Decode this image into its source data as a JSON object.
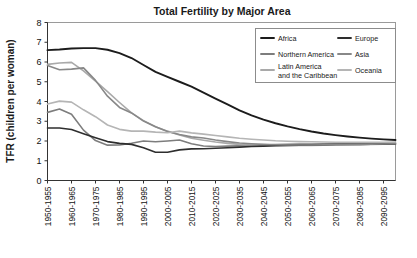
{
  "chart_data": {
    "type": "line",
    "title": "Total Fertility by Major Area",
    "xlabel": "",
    "ylabel": "TFR (children per woman)",
    "ylim": [
      0,
      8
    ],
    "yticks": [
      0,
      1,
      2,
      3,
      4,
      5,
      6,
      7,
      8
    ],
    "grid": false,
    "legend_position": "top-right",
    "categories": [
      "1950-1955",
      "1955-1960",
      "1960-1965",
      "1965-1970",
      "1970-1975",
      "1975-1980",
      "1980-1985",
      "1985-1990",
      "1990-1995",
      "1995-2000",
      "2000-2005",
      "2005-2010",
      "2010-2015",
      "2015-2020",
      "2020-2025",
      "2025-2030",
      "2030-2035",
      "2035-2040",
      "2040-2045",
      "2045-2050",
      "2050-2055",
      "2055-2060",
      "2060-2065",
      "2065-2070",
      "2070-2075",
      "2075-2080",
      "2080-2085",
      "2085-2090",
      "2090-2095",
      "2095-2100"
    ],
    "xtick_labels": [
      "1950-1955",
      "1960-1965",
      "1970-1975",
      "1980-1985",
      "1990-1995",
      "2000-2005",
      "2010-2015",
      "2020-2025",
      "2030-2035",
      "2040-2045",
      "2050-2055",
      "2060-2065",
      "2070-2075",
      "2080-2085",
      "2090-2095"
    ],
    "series": [
      {
        "name": "Africa",
        "color": "#1c1c1c",
        "width": 1.9,
        "values": [
          6.6,
          6.63,
          6.68,
          6.7,
          6.7,
          6.62,
          6.45,
          6.2,
          5.85,
          5.5,
          5.25,
          5.0,
          4.75,
          4.45,
          4.15,
          3.85,
          3.55,
          3.3,
          3.08,
          2.9,
          2.74,
          2.6,
          2.48,
          2.38,
          2.3,
          2.23,
          2.17,
          2.12,
          2.08,
          2.05
        ]
      },
      {
        "name": "Northern America",
        "color": "#7d7d7d",
        "width": 1.6,
        "values": [
          3.45,
          3.62,
          3.35,
          2.55,
          2.02,
          1.79,
          1.8,
          1.89,
          2.0,
          1.96,
          2.0,
          2.05,
          1.86,
          1.75,
          1.72,
          1.74,
          1.76,
          1.78,
          1.8,
          1.82,
          1.83,
          1.84,
          1.85,
          1.86,
          1.87,
          1.88,
          1.88,
          1.89,
          1.89,
          1.9
        ]
      },
      {
        "name": "Latin America and the Caribbean",
        "color": "#a9a9a9",
        "width": 1.6,
        "values": [
          5.88,
          5.95,
          5.98,
          5.55,
          5.03,
          4.5,
          3.95,
          3.42,
          3.03,
          2.72,
          2.5,
          2.3,
          2.14,
          2.04,
          1.95,
          1.88,
          1.83,
          1.8,
          1.78,
          1.77,
          1.77,
          1.77,
          1.78,
          1.79,
          1.8,
          1.81,
          1.82,
          1.83,
          1.84,
          1.85
        ]
      },
      {
        "name": "Europe",
        "color": "#2e2e2e",
        "width": 1.6,
        "values": [
          2.66,
          2.66,
          2.58,
          2.37,
          2.17,
          1.97,
          1.88,
          1.83,
          1.66,
          1.43,
          1.43,
          1.55,
          1.6,
          1.61,
          1.63,
          1.66,
          1.69,
          1.72,
          1.74,
          1.76,
          1.78,
          1.79,
          1.8,
          1.81,
          1.82,
          1.83,
          1.83,
          1.84,
          1.84,
          1.85
        ]
      },
      {
        "name": "Asia",
        "color": "#888888",
        "width": 1.6,
        "values": [
          5.82,
          5.61,
          5.64,
          5.7,
          5.07,
          4.27,
          3.7,
          3.42,
          3.01,
          2.72,
          2.48,
          2.33,
          2.21,
          2.15,
          2.05,
          1.97,
          1.9,
          1.86,
          1.83,
          1.81,
          1.8,
          1.8,
          1.8,
          1.81,
          1.82,
          1.83,
          1.83,
          1.84,
          1.85,
          1.86
        ]
      },
      {
        "name": "Oceania",
        "color": "#b5b5b5",
        "width": 1.6,
        "values": [
          3.87,
          4.02,
          3.97,
          3.58,
          3.23,
          2.81,
          2.59,
          2.5,
          2.5,
          2.45,
          2.42,
          2.5,
          2.41,
          2.35,
          2.28,
          2.21,
          2.14,
          2.09,
          2.05,
          2.01,
          1.99,
          1.97,
          1.96,
          1.95,
          1.94,
          1.94,
          1.94,
          1.94,
          1.94,
          1.95
        ]
      }
    ],
    "legend": {
      "left_column": [
        {
          "label": "Africa",
          "color": "#1c1c1c"
        },
        {
          "label": "Northern America",
          "color": "#7d7d7d"
        },
        {
          "label": "Latin America",
          "label2": "and the Caribbean",
          "color": "#a9a9a9"
        }
      ],
      "right_column": [
        {
          "label": "Europe",
          "color": "#2e2e2e"
        },
        {
          "label": "Asia",
          "color": "#888888"
        },
        {
          "label": "Oceania",
          "color": "#b5b5b5"
        }
      ]
    }
  }
}
